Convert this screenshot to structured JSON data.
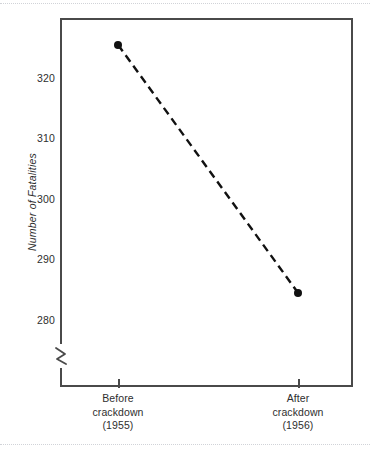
{
  "chart_data": {
    "type": "line",
    "title": "",
    "subtitle": "",
    "xlabel": "",
    "ylabel": "Number of Fatalities",
    "categories": [
      "Before crackdown (1955)",
      "After crackdown (1956)"
    ],
    "x": [
      0,
      1
    ],
    "values": [
      325.5,
      284.5
    ],
    "series": [
      {
        "name": "Connecticut traffic fatalities",
        "values": [
          325.5,
          284.5
        ],
        "line_style": "dashed",
        "marker": "filled-circle",
        "color": "#111111"
      }
    ],
    "ylim": [
      275,
      328
    ],
    "yticks": [
      280,
      290,
      300,
      310,
      320
    ],
    "ytick_labels": [
      "280",
      "290",
      "300",
      "310",
      "320"
    ],
    "xticks": [
      0,
      1
    ],
    "grid": false,
    "legend": false,
    "legend_position": "none",
    "axis_break": {
      "axis": "y",
      "present": true,
      "symbol": "zigzag",
      "below_value": 280
    },
    "annotations": []
  },
  "axes": {
    "y": {
      "title": "Number of Fatalities",
      "ticks": [
        {
          "label": "320",
          "value": 320
        },
        {
          "label": "310",
          "value": 310
        },
        {
          "label": "300",
          "value": 300
        },
        {
          "label": "290",
          "value": 290
        },
        {
          "label": "280",
          "value": 280
        }
      ]
    },
    "x": {
      "ticks": [
        {
          "line1": "Before",
          "line2": "crackdown",
          "line3": "(1955)"
        },
        {
          "line1": "After",
          "line2": "crackdown",
          "line3": "(1956)"
        }
      ]
    }
  },
  "style": {
    "frame_color": "#4a4a4a",
    "text_color": "#2e2e2e",
    "series_color": "#111111",
    "background": "#ffffff",
    "scan_rule_color": "#c9ccd2"
  }
}
